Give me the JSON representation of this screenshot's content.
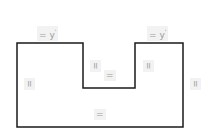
{
  "diagram": {
    "type": "u-shaped-polygon",
    "stroke_color": "#1a1a1a",
    "stroke_width": 1.5,
    "vertices": [
      [
        17,
        43
      ],
      [
        83,
        43
      ],
      [
        83,
        88
      ],
      [
        135,
        88
      ],
      [
        135,
        43
      ],
      [
        183,
        43
      ],
      [
        183,
        127
      ],
      [
        17,
        127
      ]
    ],
    "labels": {
      "top_left": "= y",
      "top_left_sup": "'",
      "top_right": "= y",
      "top_right_sup": "'",
      "left_side": "=",
      "right_side": "=",
      "notch_left": "=",
      "notch_right": "=",
      "notch_bottom": "=",
      "bottom": "="
    }
  }
}
